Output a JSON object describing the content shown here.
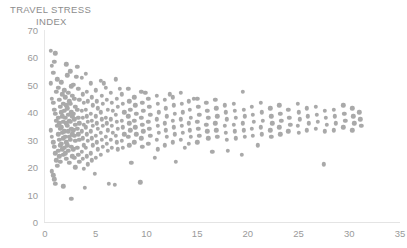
{
  "chart_data": {
    "type": "scatter",
    "title": "TRAVEL STRESS INDEX",
    "title_lines": [
      "TRAVEL STRESS",
      "INDEX"
    ],
    "xlabel": "",
    "ylabel": "",
    "xlim": [
      0,
      35
    ],
    "ylim": [
      0,
      70
    ],
    "x_ticks": [
      0,
      5,
      10,
      15,
      20,
      25,
      30,
      35
    ],
    "y_ticks": [
      0,
      10,
      20,
      30,
      40,
      50,
      60,
      70
    ],
    "grid": false,
    "legend": "none",
    "marker": {
      "shape": "circle",
      "color": "#a9a9a9",
      "size_px": 4.4
    },
    "axis_color": "#e6e6e6",
    "tick_label_color": "#9a9a9a",
    "title_color": "#8d8d8d",
    "points": [
      [
        0.6,
        62.5
      ],
      [
        0.7,
        57.0
      ],
      [
        0.8,
        54.5
      ],
      [
        0.9,
        58.5
      ],
      [
        1.0,
        61.5
      ],
      [
        1.1,
        47.5
      ],
      [
        1.2,
        52.0
      ],
      [
        0.6,
        50.5
      ],
      [
        0.7,
        45.0
      ],
      [
        0.8,
        43.5
      ],
      [
        0.9,
        41.0
      ],
      [
        1.0,
        39.5
      ],
      [
        1.1,
        37.0
      ],
      [
        1.2,
        35.0
      ],
      [
        0.6,
        33.5
      ],
      [
        0.7,
        31.0
      ],
      [
        0.8,
        29.0
      ],
      [
        0.9,
        27.5
      ],
      [
        1.0,
        25.0
      ],
      [
        1.1,
        22.5
      ],
      [
        1.2,
        20.5
      ],
      [
        0.7,
        18.5
      ],
      [
        0.8,
        17.0
      ],
      [
        0.9,
        15.5
      ],
      [
        1.0,
        14.0
      ],
      [
        1.3,
        49.0
      ],
      [
        1.4,
        44.5
      ],
      [
        1.5,
        42.0
      ],
      [
        1.3,
        38.0
      ],
      [
        1.4,
        36.0
      ],
      [
        1.5,
        34.0
      ],
      [
        1.3,
        32.0
      ],
      [
        1.4,
        30.0
      ],
      [
        1.5,
        28.0
      ],
      [
        1.3,
        26.0
      ],
      [
        1.4,
        24.0
      ],
      [
        1.5,
        22.0
      ],
      [
        1.6,
        51.0
      ],
      [
        1.7,
        46.5
      ],
      [
        1.8,
        43.0
      ],
      [
        1.6,
        40.0
      ],
      [
        1.7,
        38.5
      ],
      [
        1.8,
        36.5
      ],
      [
        1.6,
        34.5
      ],
      [
        1.7,
        32.5
      ],
      [
        1.8,
        30.5
      ],
      [
        1.6,
        28.5
      ],
      [
        1.7,
        26.5
      ],
      [
        1.8,
        24.5
      ],
      [
        1.9,
        48.0
      ],
      [
        2.0,
        45.5
      ],
      [
        2.1,
        42.5
      ],
      [
        1.9,
        40.5
      ],
      [
        2.0,
        38.0
      ],
      [
        2.1,
        36.0
      ],
      [
        1.9,
        33.0
      ],
      [
        2.0,
        31.0
      ],
      [
        2.1,
        29.0
      ],
      [
        1.9,
        27.0
      ],
      [
        2.0,
        25.0
      ],
      [
        2.1,
        23.0
      ],
      [
        2.2,
        53.5
      ],
      [
        2.3,
        47.0
      ],
      [
        2.4,
        44.0
      ],
      [
        2.2,
        41.5
      ],
      [
        2.3,
        39.0
      ],
      [
        2.4,
        37.0
      ],
      [
        2.2,
        35.0
      ],
      [
        2.3,
        33.0
      ],
      [
        2.4,
        31.0
      ],
      [
        2.2,
        28.0
      ],
      [
        2.3,
        26.0
      ],
      [
        2.4,
        21.5
      ],
      [
        2.5,
        55.0
      ],
      [
        2.6,
        49.5
      ],
      [
        2.7,
        46.0
      ],
      [
        2.5,
        43.0
      ],
      [
        2.6,
        40.0
      ],
      [
        2.7,
        38.5
      ],
      [
        2.5,
        36.5
      ],
      [
        2.6,
        34.0
      ],
      [
        2.7,
        32.0
      ],
      [
        2.5,
        30.0
      ],
      [
        2.6,
        27.5
      ],
      [
        2.7,
        24.0
      ],
      [
        2.8,
        50.0
      ],
      [
        2.9,
        45.0
      ],
      [
        3.0,
        42.0
      ],
      [
        2.8,
        39.5
      ],
      [
        2.9,
        37.5
      ],
      [
        3.0,
        35.5
      ],
      [
        2.8,
        33.5
      ],
      [
        2.9,
        31.5
      ],
      [
        3.0,
        29.5
      ],
      [
        2.8,
        26.5
      ],
      [
        2.9,
        23.5
      ],
      [
        3.0,
        20.0
      ],
      [
        3.2,
        56.5
      ],
      [
        3.3,
        48.5
      ],
      [
        3.4,
        44.5
      ],
      [
        3.2,
        41.0
      ],
      [
        3.3,
        38.0
      ],
      [
        3.4,
        36.0
      ],
      [
        3.2,
        34.0
      ],
      [
        3.3,
        32.0
      ],
      [
        3.4,
        30.0
      ],
      [
        3.2,
        27.0
      ],
      [
        3.3,
        24.5
      ],
      [
        3.4,
        22.0
      ],
      [
        3.6,
        52.5
      ],
      [
        3.7,
        46.5
      ],
      [
        3.8,
        43.5
      ],
      [
        3.6,
        40.5
      ],
      [
        3.7,
        38.0
      ],
      [
        3.8,
        35.5
      ],
      [
        3.6,
        33.0
      ],
      [
        3.7,
        30.5
      ],
      [
        3.8,
        28.0
      ],
      [
        3.6,
        25.5
      ],
      [
        3.7,
        23.0
      ],
      [
        3.8,
        19.5
      ],
      [
        4.0,
        54.0
      ],
      [
        4.1,
        47.5
      ],
      [
        4.2,
        44.0
      ],
      [
        4.0,
        41.0
      ],
      [
        4.1,
        38.5
      ],
      [
        4.2,
        36.5
      ],
      [
        4.0,
        34.5
      ],
      [
        4.1,
        32.0
      ],
      [
        4.2,
        29.5
      ],
      [
        4.0,
        27.0
      ],
      [
        4.1,
        24.0
      ],
      [
        4.2,
        21.0
      ],
      [
        4.5,
        50.5
      ],
      [
        4.6,
        45.5
      ],
      [
        4.7,
        42.5
      ],
      [
        4.5,
        39.5
      ],
      [
        4.6,
        37.0
      ],
      [
        4.7,
        35.0
      ],
      [
        4.5,
        33.0
      ],
      [
        4.6,
        30.5
      ],
      [
        4.7,
        28.0
      ],
      [
        4.5,
        25.0
      ],
      [
        4.6,
        22.5
      ],
      [
        5.0,
        48.0
      ],
      [
        5.1,
        44.0
      ],
      [
        5.2,
        41.5
      ],
      [
        5.0,
        38.5
      ],
      [
        5.1,
        36.0
      ],
      [
        5.2,
        34.0
      ],
      [
        5.0,
        31.5
      ],
      [
        5.1,
        29.0
      ],
      [
        5.2,
        26.5
      ],
      [
        5.0,
        23.5
      ],
      [
        5.5,
        51.5
      ],
      [
        5.6,
        46.0
      ],
      [
        5.7,
        43.0
      ],
      [
        5.5,
        40.0
      ],
      [
        5.6,
        37.5
      ],
      [
        5.7,
        35.0
      ],
      [
        5.5,
        32.5
      ],
      [
        5.6,
        30.0
      ],
      [
        5.7,
        27.5
      ],
      [
        5.5,
        24.5
      ],
      [
        6.0,
        49.0
      ],
      [
        6.1,
        44.5
      ],
      [
        6.2,
        41.0
      ],
      [
        6.0,
        38.0
      ],
      [
        6.1,
        36.0
      ],
      [
        6.2,
        33.5
      ],
      [
        6.0,
        31.0
      ],
      [
        6.1,
        28.5
      ],
      [
        6.2,
        26.0
      ],
      [
        6.5,
        47.0
      ],
      [
        6.6,
        43.5
      ],
      [
        6.7,
        40.5
      ],
      [
        6.5,
        37.5
      ],
      [
        6.6,
        35.0
      ],
      [
        6.7,
        32.5
      ],
      [
        6.5,
        30.0
      ],
      [
        6.6,
        27.0
      ],
      [
        7.0,
        52.0
      ],
      [
        7.1,
        45.0
      ],
      [
        7.2,
        42.0
      ],
      [
        7.0,
        39.0
      ],
      [
        7.1,
        36.5
      ],
      [
        7.2,
        34.0
      ],
      [
        7.0,
        31.5
      ],
      [
        7.1,
        29.0
      ],
      [
        7.2,
        26.5
      ],
      [
        7.6,
        46.5
      ],
      [
        7.7,
        43.0
      ],
      [
        7.8,
        40.0
      ],
      [
        7.6,
        37.0
      ],
      [
        7.7,
        34.5
      ],
      [
        7.8,
        32.0
      ],
      [
        7.6,
        29.5
      ],
      [
        7.7,
        27.0
      ],
      [
        8.2,
        48.5
      ],
      [
        8.3,
        44.0
      ],
      [
        8.4,
        41.0
      ],
      [
        8.2,
        38.5
      ],
      [
        8.3,
        36.0
      ],
      [
        8.4,
        33.5
      ],
      [
        8.2,
        31.0
      ],
      [
        8.3,
        28.0
      ],
      [
        8.8,
        45.5
      ],
      [
        8.9,
        42.5
      ],
      [
        9.0,
        39.5
      ],
      [
        8.8,
        37.0
      ],
      [
        8.9,
        34.5
      ],
      [
        9.0,
        32.0
      ],
      [
        8.8,
        29.0
      ],
      [
        9.5,
        47.5
      ],
      [
        9.6,
        43.5
      ],
      [
        9.7,
        40.5
      ],
      [
        9.5,
        38.0
      ],
      [
        9.6,
        35.5
      ],
      [
        9.7,
        33.0
      ],
      [
        9.5,
        30.5
      ],
      [
        9.6,
        27.5
      ],
      [
        9.4,
        14.5
      ],
      [
        10.2,
        45.0
      ],
      [
        10.3,
        42.0
      ],
      [
        10.4,
        39.0
      ],
      [
        10.2,
        36.5
      ],
      [
        10.3,
        34.0
      ],
      [
        10.4,
        31.5
      ],
      [
        10.2,
        28.5
      ],
      [
        11.0,
        46.0
      ],
      [
        11.1,
        43.0
      ],
      [
        11.2,
        40.0
      ],
      [
        11.0,
        37.5
      ],
      [
        11.1,
        35.0
      ],
      [
        11.2,
        32.5
      ],
      [
        11.0,
        30.0
      ],
      [
        11.1,
        26.5
      ],
      [
        11.8,
        44.5
      ],
      [
        11.9,
        41.5
      ],
      [
        12.0,
        38.5
      ],
      [
        11.8,
        36.0
      ],
      [
        11.9,
        33.5
      ],
      [
        12.0,
        31.0
      ],
      [
        11.8,
        28.0
      ],
      [
        12.6,
        45.5
      ],
      [
        12.7,
        42.5
      ],
      [
        12.8,
        39.5
      ],
      [
        12.6,
        37.0
      ],
      [
        12.7,
        34.5
      ],
      [
        12.8,
        32.0
      ],
      [
        12.6,
        29.0
      ],
      [
        13.4,
        47.0
      ],
      [
        13.5,
        43.0
      ],
      [
        13.6,
        40.0
      ],
      [
        13.4,
        37.5
      ],
      [
        13.5,
        35.0
      ],
      [
        13.6,
        32.5
      ],
      [
        13.4,
        30.0
      ],
      [
        14.2,
        44.0
      ],
      [
        14.3,
        41.0
      ],
      [
        14.4,
        38.0
      ],
      [
        14.2,
        36.0
      ],
      [
        14.3,
        33.5
      ],
      [
        14.4,
        31.0
      ],
      [
        14.2,
        28.5
      ],
      [
        15.0,
        45.0
      ],
      [
        15.1,
        42.0
      ],
      [
        15.2,
        39.0
      ],
      [
        15.0,
        36.5
      ],
      [
        15.1,
        34.0
      ],
      [
        15.2,
        31.5
      ],
      [
        15.0,
        29.0
      ],
      [
        15.9,
        43.5
      ],
      [
        16.0,
        40.5
      ],
      [
        16.1,
        38.0
      ],
      [
        15.9,
        35.5
      ],
      [
        16.0,
        33.0
      ],
      [
        16.1,
        30.5
      ],
      [
        16.8,
        44.5
      ],
      [
        16.9,
        41.5
      ],
      [
        17.0,
        38.5
      ],
      [
        16.8,
        36.0
      ],
      [
        16.9,
        33.5
      ],
      [
        17.0,
        31.0
      ],
      [
        17.7,
        42.5
      ],
      [
        17.8,
        40.0
      ],
      [
        17.9,
        37.5
      ],
      [
        17.7,
        35.0
      ],
      [
        17.8,
        32.5
      ],
      [
        17.9,
        30.0
      ],
      [
        18.6,
        43.0
      ],
      [
        18.7,
        40.5
      ],
      [
        18.8,
        38.0
      ],
      [
        18.6,
        35.5
      ],
      [
        18.7,
        33.0
      ],
      [
        18.8,
        30.5
      ],
      [
        19.5,
        47.5
      ],
      [
        19.6,
        41.0
      ],
      [
        19.7,
        38.5
      ],
      [
        19.5,
        36.0
      ],
      [
        19.6,
        33.5
      ],
      [
        19.7,
        31.0
      ],
      [
        19.4,
        24.5
      ],
      [
        20.4,
        42.0
      ],
      [
        20.5,
        39.0
      ],
      [
        20.6,
        36.5
      ],
      [
        20.4,
        34.0
      ],
      [
        20.5,
        31.5
      ],
      [
        21.3,
        43.5
      ],
      [
        21.4,
        40.0
      ],
      [
        21.5,
        37.0
      ],
      [
        21.3,
        34.5
      ],
      [
        21.4,
        32.0
      ],
      [
        22.2,
        41.5
      ],
      [
        22.3,
        38.5
      ],
      [
        22.4,
        36.0
      ],
      [
        22.2,
        33.5
      ],
      [
        22.3,
        31.0
      ],
      [
        23.1,
        42.5
      ],
      [
        23.2,
        39.5
      ],
      [
        23.3,
        37.0
      ],
      [
        23.1,
        34.5
      ],
      [
        23.2,
        32.0
      ],
      [
        24.0,
        41.0
      ],
      [
        24.1,
        38.0
      ],
      [
        24.2,
        35.5
      ],
      [
        24.0,
        33.0
      ],
      [
        24.9,
        43.0
      ],
      [
        25.0,
        40.0
      ],
      [
        25.1,
        37.5
      ],
      [
        24.9,
        35.0
      ],
      [
        25.0,
        32.5
      ],
      [
        25.8,
        41.5
      ],
      [
        25.9,
        38.5
      ],
      [
        26.0,
        36.0
      ],
      [
        25.8,
        33.5
      ],
      [
        26.7,
        42.0
      ],
      [
        26.8,
        39.0
      ],
      [
        26.9,
        36.5
      ],
      [
        26.7,
        34.0
      ],
      [
        27.6,
        40.5
      ],
      [
        27.7,
        38.0
      ],
      [
        27.8,
        35.5
      ],
      [
        27.6,
        33.0
      ],
      [
        27.5,
        21.0
      ],
      [
        28.5,
        41.0
      ],
      [
        28.6,
        38.5
      ],
      [
        28.7,
        36.0
      ],
      [
        28.5,
        33.5
      ],
      [
        29.4,
        42.5
      ],
      [
        29.5,
        39.5
      ],
      [
        29.6,
        37.0
      ],
      [
        29.4,
        34.5
      ],
      [
        30.3,
        41.5
      ],
      [
        30.4,
        38.5
      ],
      [
        30.5,
        36.0
      ],
      [
        30.3,
        33.5
      ],
      [
        31.0,
        40.0
      ],
      [
        31.1,
        37.5
      ],
      [
        31.2,
        35.0
      ],
      [
        2.6,
        8.5
      ],
      [
        3.9,
        12.5
      ],
      [
        6.3,
        14.0
      ],
      [
        1.8,
        13.0
      ],
      [
        12.9,
        22.0
      ],
      [
        16.5,
        25.5
      ],
      [
        10.8,
        23.5
      ],
      [
        8.5,
        21.5
      ],
      [
        4.9,
        17.5
      ],
      [
        13.8,
        27.0
      ],
      [
        21.0,
        28.0
      ],
      [
        18.0,
        26.0
      ],
      [
        2.1,
        57.5
      ],
      [
        3.1,
        53.0
      ],
      [
        5.8,
        50.5
      ],
      [
        7.4,
        48.5
      ],
      [
        9.9,
        47.0
      ],
      [
        12.3,
        46.5
      ],
      [
        14.7,
        45.0
      ],
      [
        6.9,
        13.5
      ]
    ]
  }
}
